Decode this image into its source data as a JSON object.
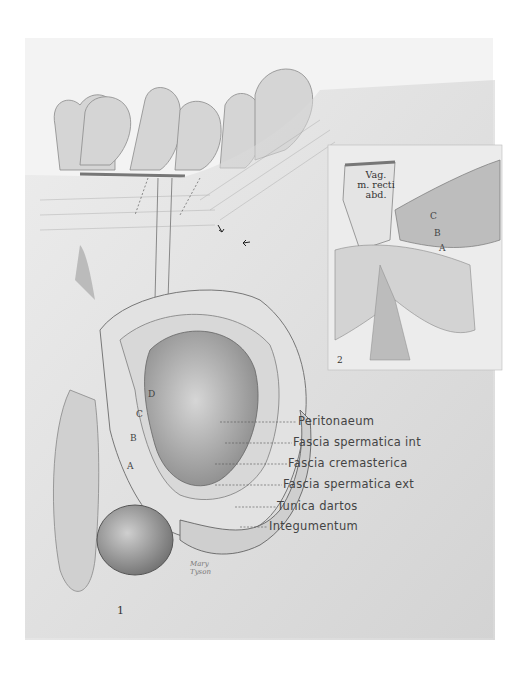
{
  "figure": {
    "main_figure_number": "1",
    "inset_figure_number": "2",
    "signature": [
      "Mary",
      "Tyson"
    ]
  },
  "labels": [
    {
      "text": "Peritonaeum",
      "y": 422
    },
    {
      "text": "Fascia spermatica int",
      "y": 443
    },
    {
      "text": "Fascia cremasterica",
      "y": 464
    },
    {
      "text": "Fascia spermatica ext",
      "y": 485
    },
    {
      "text": "Tunica dartos",
      "y": 507
    },
    {
      "text": "Integumentum",
      "y": 527
    }
  ],
  "layer_letters": {
    "main": [
      "D",
      "C",
      "B",
      "A"
    ],
    "inset": [
      "C",
      "B",
      "A"
    ]
  },
  "inset": {
    "caption_lines": [
      "Vag.",
      "m. recti",
      "abd."
    ]
  },
  "colors": {
    "paper": "#f3f3f3",
    "ink": "#444444",
    "shade_dark": "#555555",
    "shade_mid": "#a8a8a8",
    "shade_light": "#dcdcdc"
  }
}
